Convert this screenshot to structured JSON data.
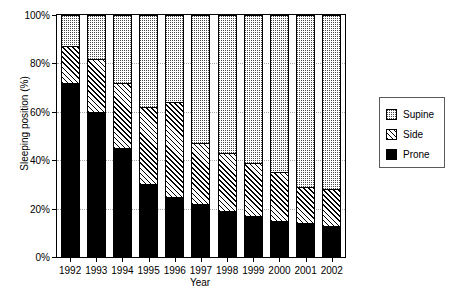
{
  "chart_data": {
    "type": "bar",
    "stacked": true,
    "title": "",
    "xlabel": "Year",
    "ylabel": "Sleeping position (%)",
    "categories": [
      "1992",
      "1993",
      "1994",
      "1995",
      "1996",
      "1997",
      "1998",
      "1999",
      "2000",
      "2001",
      "2002"
    ],
    "ylim": [
      0,
      100
    ],
    "yticks": [
      0,
      20,
      40,
      60,
      80,
      100
    ],
    "ytick_labels": [
      "0%",
      "20%",
      "40%",
      "60%",
      "80%",
      "100%"
    ],
    "grid": true,
    "grid_axis": "y",
    "legend_position": "right",
    "series": [
      {
        "name": "Prone",
        "pattern": "solid-black",
        "color": "#000000",
        "values": [
          72,
          60,
          45,
          30,
          25,
          22,
          19,
          17,
          15,
          14,
          13
        ]
      },
      {
        "name": "Side",
        "pattern": "diagonal-hatch",
        "color": "#ffffff",
        "values": [
          15,
          22,
          27,
          32,
          39,
          25,
          24,
          22,
          20,
          15,
          15
        ]
      },
      {
        "name": "Supine",
        "pattern": "dotted",
        "color": "#ffffff",
        "values": [
          13,
          18,
          28,
          38,
          36,
          53,
          57,
          61,
          65,
          71,
          72
        ]
      }
    ],
    "cumulative_tops": {
      "prone": [
        72,
        60,
        45,
        30,
        25,
        22,
        19,
        17,
        15,
        14,
        13
      ],
      "prone_plus_side": [
        87,
        82,
        72,
        62,
        64,
        47,
        43,
        39,
        35,
        29,
        28
      ],
      "total": [
        100,
        100,
        100,
        100,
        100,
        100,
        100,
        100,
        100,
        100,
        100
      ]
    }
  },
  "legend": {
    "items": [
      {
        "label": "Supine"
      },
      {
        "label": "Side"
      },
      {
        "label": "Prone"
      }
    ]
  }
}
